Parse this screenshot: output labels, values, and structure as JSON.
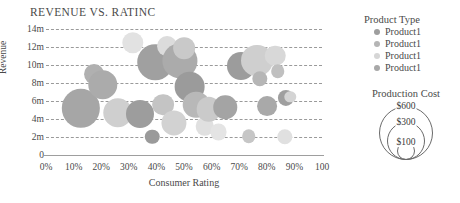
{
  "title": "REVENUE VS. RATINC",
  "axes": {
    "x": {
      "label": "Consumer Rating",
      "ticks": [
        "0%",
        "10%",
        "20%",
        "30%",
        "40%",
        "50%",
        "60%",
        "70%",
        "80%",
        "90%",
        "100"
      ],
      "min": 0,
      "max": 100
    },
    "y": {
      "label": "Revenue",
      "ticks": [
        "0",
        "2m",
        "4m",
        "6m",
        "8m",
        "10m",
        "12m",
        "14m"
      ],
      "min": 0,
      "max": 14
    },
    "grid": "horizontal-dashed"
  },
  "legend_product": {
    "title": "Product Type",
    "items": [
      {
        "label": "Product1",
        "color": "#9e9e9e"
      },
      {
        "label": "Product1",
        "color": "#b5b5b5"
      },
      {
        "label": "Product1",
        "color": "#d6d6d6"
      },
      {
        "label": "Product1",
        "color": "#a8a8a8"
      }
    ]
  },
  "legend_size": {
    "title": "Production Cost",
    "items": [
      {
        "label": "$600",
        "radius": 26
      },
      {
        "label": "$300",
        "radius": 18
      },
      {
        "label": "$100",
        "radius": 8
      }
    ]
  },
  "colors": {
    "grid": "#9a9a9a",
    "axis": "#9e9e9e",
    "text": "#4a4a4a",
    "background": "#ffffff"
  },
  "chart_data": {
    "type": "scatter",
    "title": "REVENUE VS. RATINC",
    "xlabel": "Consumer Rating",
    "ylabel": "Revenue",
    "xlim": [
      0,
      100
    ],
    "ylim": [
      0,
      14
    ],
    "grid": true,
    "legend_position": "right",
    "size_encodes": "Production Cost",
    "size_legend_values": [
      600,
      300,
      100
    ],
    "points": [
      {
        "x": 12.5,
        "y": 5.2,
        "size": 560,
        "color": "#a6a6a6"
      },
      {
        "x": 17.5,
        "y": 9.0,
        "size": 150,
        "color": "#b0b0b0"
      },
      {
        "x": 20.5,
        "y": 7.8,
        "size": 330,
        "color": "#ababab"
      },
      {
        "x": 26.0,
        "y": 4.7,
        "size": 330,
        "color": "#cfcfcf"
      },
      {
        "x": 31.5,
        "y": 12.5,
        "size": 175,
        "color": "#e2e2e2"
      },
      {
        "x": 34.0,
        "y": 4.6,
        "size": 300,
        "color": "#9d9d9d"
      },
      {
        "x": 38.5,
        "y": 2.0,
        "size": 80,
        "color": "#9a9a9a"
      },
      {
        "x": 39.5,
        "y": 10.3,
        "size": 480,
        "color": "#a0a0a0"
      },
      {
        "x": 42.5,
        "y": 5.6,
        "size": 180,
        "color": "#c4c4c4"
      },
      {
        "x": 44.0,
        "y": 12.1,
        "size": 150,
        "color": "#dcdcdc"
      },
      {
        "x": 46.5,
        "y": 3.6,
        "size": 240,
        "color": "#d2d2d2"
      },
      {
        "x": 48.5,
        "y": 10.5,
        "size": 470,
        "color": "#ababab"
      },
      {
        "x": 50.0,
        "y": 11.9,
        "size": 180,
        "color": "#c9c9c9"
      },
      {
        "x": 52.0,
        "y": 7.6,
        "size": 360,
        "color": "#9b9b9b"
      },
      {
        "x": 54.5,
        "y": 5.6,
        "size": 270,
        "color": "#b8b8b8"
      },
      {
        "x": 57.5,
        "y": 3.2,
        "size": 130,
        "color": "#e0e0e0"
      },
      {
        "x": 59.0,
        "y": 5.1,
        "size": 230,
        "color": "#cacaca"
      },
      {
        "x": 62.5,
        "y": 2.6,
        "size": 110,
        "color": "#e4e4e4"
      },
      {
        "x": 65.0,
        "y": 5.3,
        "size": 210,
        "color": "#a4a4a4"
      },
      {
        "x": 70.5,
        "y": 9.9,
        "size": 300,
        "color": "#9c9c9c"
      },
      {
        "x": 73.5,
        "y": 2.1,
        "size": 70,
        "color": "#c6c6c6"
      },
      {
        "x": 76.5,
        "y": 10.5,
        "size": 390,
        "color": "#cfcfcf"
      },
      {
        "x": 77.5,
        "y": 8.5,
        "size": 90,
        "color": "#b6b6b6"
      },
      {
        "x": 80.0,
        "y": 5.4,
        "size": 150,
        "color": "#a9a9a9"
      },
      {
        "x": 83.0,
        "y": 11.0,
        "size": 160,
        "color": "#d8d8d8"
      },
      {
        "x": 84.0,
        "y": 9.3,
        "size": 70,
        "color": "#c0c0c0"
      },
      {
        "x": 86.5,
        "y": 2.0,
        "size": 90,
        "color": "#e0e0e0"
      },
      {
        "x": 87.0,
        "y": 6.3,
        "size": 100,
        "color": "#9f9f9f"
      },
      {
        "x": 88.5,
        "y": 6.5,
        "size": 50,
        "color": "#d4d4d4"
      }
    ]
  }
}
